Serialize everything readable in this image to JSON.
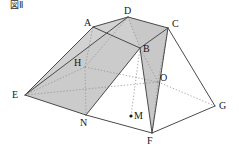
{
  "figure": {
    "title": "図Ⅱ",
    "type": "3d-solid-geometry-diagram",
    "colors": {
      "stroke": "#4a4a4a",
      "hidden_stroke": "#8d8d8d",
      "fill_light": "#d2d2d2",
      "fill_mid": "#c8c8c8",
      "fill_top": "#cfcfcf",
      "label": "#161616",
      "background": "#ffffff"
    },
    "vertices": [
      {
        "name": "A",
        "x": 93,
        "y": 27,
        "label_x": 84,
        "label_y": 18,
        "hidden": false
      },
      {
        "name": "D",
        "x": 128,
        "y": 17,
        "label_x": 124,
        "label_y": 6,
        "hidden": false
      },
      {
        "name": "C",
        "x": 168,
        "y": 28,
        "label_x": 172,
        "label_y": 19,
        "hidden": false
      },
      {
        "name": "B",
        "x": 140,
        "y": 48,
        "label_x": 143,
        "label_y": 44,
        "hidden": false
      },
      {
        "name": "H",
        "x": 85,
        "y": 67,
        "label_x": 74,
        "label_y": 58,
        "hidden": true
      },
      {
        "name": "O",
        "x": 158,
        "y": 82,
        "label_x": 160,
        "label_y": 73,
        "hidden": true
      },
      {
        "name": "E",
        "x": 25,
        "y": 95,
        "label_x": 12,
        "label_y": 90,
        "hidden": false
      },
      {
        "name": "G",
        "x": 215,
        "y": 106,
        "label_x": 219,
        "label_y": 101,
        "hidden": false
      },
      {
        "name": "N",
        "x": 86,
        "y": 115,
        "label_x": 80,
        "label_y": 118,
        "hidden": false
      },
      {
        "name": "F",
        "x": 152,
        "y": 133,
        "label_x": 147,
        "label_y": 136,
        "hidden": false
      },
      {
        "name": "M",
        "x": 131,
        "y": 116,
        "label_x": 134,
        "label_y": 111,
        "hidden": false
      }
    ],
    "point_markers": [
      {
        "name": "M",
        "x": 131,
        "y": 116,
        "r": 1.6
      }
    ],
    "faces": [
      {
        "name": "top-face-ABCD",
        "points": "93,27 128,17 168,28 140,48",
        "fill": "#cfcfcf"
      },
      {
        "name": "left-face-AEND",
        "points": "93,27 25,95 86,115 140,48",
        "fill": "#cbcbcb"
      },
      {
        "name": "back-face-ADE",
        "points": "93,27 128,17 25,95",
        "fill": "#d2d2d2"
      },
      {
        "name": "right-face-DCBF",
        "points": "128,17 168,28 152,133 140,48",
        "fill": "#c8c8c8"
      }
    ],
    "solid_edges": [
      {
        "name": "edge-A-D",
        "x1": 93,
        "y1": 27,
        "x2": 128,
        "y2": 17
      },
      {
        "name": "edge-D-C",
        "x1": 128,
        "y1": 17,
        "x2": 168,
        "y2": 28
      },
      {
        "name": "edge-A-B",
        "x1": 93,
        "y1": 27,
        "x2": 140,
        "y2": 48
      },
      {
        "name": "edge-B-C",
        "x1": 140,
        "y1": 48,
        "x2": 168,
        "y2": 28
      },
      {
        "name": "edge-A-E",
        "x1": 93,
        "y1": 27,
        "x2": 25,
        "y2": 95
      },
      {
        "name": "edge-D-E",
        "x1": 128,
        "y1": 17,
        "x2": 25,
        "y2": 95
      },
      {
        "name": "edge-E-N",
        "x1": 25,
        "y1": 95,
        "x2": 86,
        "y2": 115
      },
      {
        "name": "edge-N-F",
        "x1": 86,
        "y1": 115,
        "x2": 152,
        "y2": 133
      },
      {
        "name": "edge-F-G",
        "x1": 152,
        "y1": 133,
        "x2": 215,
        "y2": 106
      },
      {
        "name": "edge-C-G",
        "x1": 168,
        "y1": 28,
        "x2": 215,
        "y2": 106
      },
      {
        "name": "edge-C-F",
        "x1": 168,
        "y1": 28,
        "x2": 152,
        "y2": 133
      },
      {
        "name": "edge-B-N",
        "x1": 140,
        "y1": 48,
        "x2": 86,
        "y2": 115
      },
      {
        "name": "edge-B-F",
        "x1": 140,
        "y1": 48,
        "x2": 152,
        "y2": 133
      }
    ],
    "hidden_edges": [
      {
        "name": "edge-E-H",
        "x1": 25,
        "y1": 95,
        "x2": 85,
        "y2": 67
      },
      {
        "name": "edge-H-O",
        "x1": 85,
        "y1": 67,
        "x2": 158,
        "y2": 82
      },
      {
        "name": "edge-O-G",
        "x1": 158,
        "y1": 82,
        "x2": 215,
        "y2": 106
      },
      {
        "name": "edge-H-A",
        "x1": 85,
        "y1": 67,
        "x2": 93,
        "y2": 27
      },
      {
        "name": "edge-H-N",
        "x1": 85,
        "y1": 67,
        "x2": 86,
        "y2": 115
      },
      {
        "name": "edge-H-D",
        "x1": 85,
        "y1": 67,
        "x2": 128,
        "y2": 17
      },
      {
        "name": "edge-O-B",
        "x1": 158,
        "y1": 82,
        "x2": 140,
        "y2": 48
      },
      {
        "name": "edge-O-C",
        "x1": 158,
        "y1": 82,
        "x2": 168,
        "y2": 28
      },
      {
        "name": "edge-O-F",
        "x1": 158,
        "y1": 82,
        "x2": 152,
        "y2": 133
      },
      {
        "name": "edge-D-B",
        "x1": 128,
        "y1": 17,
        "x2": 140,
        "y2": 48
      },
      {
        "name": "edge-E-O",
        "x1": 25,
        "y1": 95,
        "x2": 158,
        "y2": 82
      },
      {
        "name": "edge-B-M",
        "x1": 140,
        "y1": 48,
        "x2": 131,
        "y2": 116
      }
    ]
  }
}
